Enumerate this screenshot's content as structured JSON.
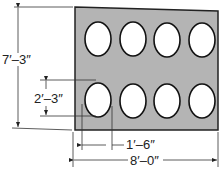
{
  "figure": {
    "type": "dimensioned plate drawing",
    "plate": {
      "fill": "#b4b4b4",
      "stroke": "#222222",
      "holes_rows": 2,
      "holes_cols": 4,
      "hole_fill": "#ffffff"
    },
    "dimensions": {
      "height": {
        "label": "7′–3″"
      },
      "hole_height": {
        "label": "2′–3″"
      },
      "hole_width": {
        "label": "1′–6″"
      },
      "width": {
        "label": "8′–0″"
      }
    }
  }
}
